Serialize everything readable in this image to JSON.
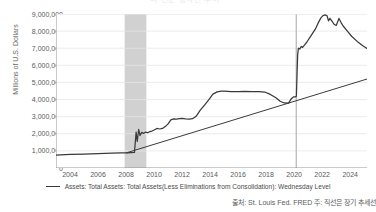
{
  "title_fragment": "미 연준 총자산 추이",
  "legend": {
    "series_label": "Assets: Total Assets: Total Assets(Less Eliminations from Consolidation): Wednesday Level"
  },
  "source_note": "출처: St. Louis Fed. FRED 주: 직선은 장기 추세선",
  "colors": {
    "series_line": "#3a3a3a",
    "trend_line": "#3a3a3a",
    "recession_band": "#c9c9c9",
    "marker_line": "#b5b5b5",
    "grid": "#e6e6e6",
    "axis": "#8a8a8a",
    "text": "#4a4a4a"
  },
  "chart_data": {
    "type": "line",
    "title": "미 연준 총자산 추이",
    "xlabel": "",
    "ylabel": "Millions of U.S. Dollars",
    "xlim": [
      2003.0,
      2025.2
    ],
    "ylim": [
      0,
      9000000
    ],
    "grid": true,
    "legend_position": "bottom",
    "ytick_labels": [
      "0",
      "1,000,000",
      "2,000,000",
      "3,000,000",
      "4,000,000",
      "5,000,000",
      "6,000,000",
      "7,000,000",
      "8,000,000",
      "9,000,000"
    ],
    "ytick_values": [
      0,
      1000000,
      2000000,
      3000000,
      4000000,
      5000000,
      6000000,
      7000000,
      8000000,
      9000000
    ],
    "xtick_labels": [
      "2004",
      "2006",
      "2008",
      "2010",
      "2012",
      "2014",
      "2016",
      "2018",
      "2020",
      "2022",
      "2024"
    ],
    "xtick_values": [
      2004,
      2006,
      2008,
      2010,
      2012,
      2014,
      2016,
      2018,
      2020,
      2022,
      2024
    ],
    "annotations": [
      {
        "kind": "band",
        "label": "2008 recession",
        "x0": 2007.9,
        "x1": 2009.45
      },
      {
        "kind": "vline",
        "label": "2020 marker",
        "x": 2020.15
      }
    ],
    "series": [
      {
        "name": "Assets: Total Assets: Total Assets(Less Eliminations from Consolidation): Wednesday Level",
        "x": [
          2003.0,
          2004.0,
          2005.0,
          2006.0,
          2007.0,
          2007.6,
          2007.95,
          2008.1,
          2008.35,
          2008.6,
          2008.72,
          2008.8,
          2008.9,
          2009.0,
          2009.12,
          2009.25,
          2009.4,
          2009.55,
          2009.7,
          2009.85,
          2010.0,
          2010.2,
          2010.4,
          2010.6,
          2010.8,
          2011.0,
          2011.2,
          2011.4,
          2011.6,
          2011.8,
          2012.0,
          2012.25,
          2012.5,
          2012.75,
          2013.0,
          2013.3,
          2013.6,
          2013.9,
          2014.2,
          2014.5,
          2014.8,
          2015.0,
          2015.5,
          2016.0,
          2016.5,
          2017.0,
          2017.5,
          2017.9,
          2018.3,
          2018.7,
          2019.0,
          2019.3,
          2019.6,
          2019.8,
          2019.95,
          2020.1,
          2020.16,
          2020.2,
          2020.25,
          2020.3,
          2020.4,
          2020.5,
          2020.6,
          2020.75,
          2020.9,
          2021.1,
          2021.3,
          2021.5,
          2021.7,
          2021.9,
          2022.05,
          2022.2,
          2022.35,
          2022.45,
          2022.55,
          2022.7,
          2022.85,
          2023.0,
          2023.2,
          2023.35,
          2023.5,
          2023.8,
          2024.1,
          2024.5,
          2024.9,
          2025.2
        ],
        "y": [
          750000,
          790000,
          810000,
          840000,
          870000,
          880000,
          890000,
          880000,
          900000,
          910000,
          2100000,
          1550000,
          2250000,
          1900000,
          2080000,
          2020000,
          2100000,
          2060000,
          2130000,
          2160000,
          2220000,
          2310000,
          2280000,
          2310000,
          2420000,
          2580000,
          2810000,
          2870000,
          2860000,
          2880000,
          2900000,
          2870000,
          2860000,
          2880000,
          3020000,
          3380000,
          3680000,
          3980000,
          4320000,
          4450000,
          4490000,
          4490000,
          4470000,
          4470000,
          4480000,
          4470000,
          4460000,
          4440000,
          4300000,
          4100000,
          3900000,
          3800000,
          3790000,
          4050000,
          4150000,
          4150000,
          4200000,
          5300000,
          6600000,
          7000000,
          6950000,
          7100000,
          7050000,
          7200000,
          7350000,
          7600000,
          7850000,
          8100000,
          8450000,
          8760000,
          8900000,
          8950000,
          8900000,
          8600000,
          8750000,
          8580000,
          8400000,
          8330000,
          8740000,
          8500000,
          8300000,
          8000000,
          7700000,
          7400000,
          7150000,
          6980000
        ]
      },
      {
        "name": "long-term trend line",
        "x": [
          2008.0,
          2025.2
        ],
        "y": [
          880000,
          5200000
        ]
      }
    ]
  }
}
